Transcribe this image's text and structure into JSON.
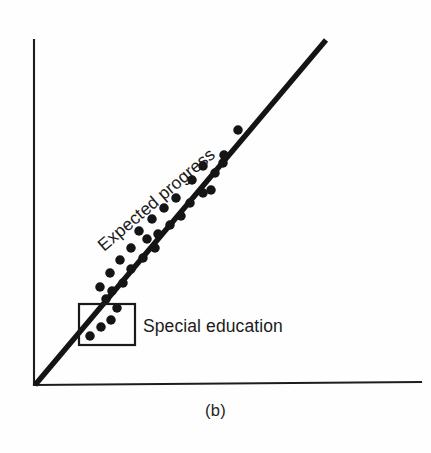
{
  "figure": {
    "caption": "(b)",
    "background_color": "#fefefe",
    "ink_color": "#151515",
    "labels": {
      "trend_line": "Expected progress",
      "callout": "Special education"
    }
  },
  "chart_data": {
    "type": "scatter",
    "title": "",
    "subtitle": "",
    "xlabel": "",
    "ylabel": "",
    "grid": false,
    "legend_position": "none",
    "axes": {
      "x_axis": {
        "x1": 34,
        "y1": 385,
        "x2": 421,
        "y2": 382,
        "ticks": [],
        "tick_labels": []
      },
      "y_axis": {
        "x1": 34,
        "y1": 40,
        "x2": 34,
        "y2": 385,
        "ticks": [],
        "tick_labels": []
      },
      "xlim": [
        0,
        1
      ],
      "ylim": [
        0,
        1
      ]
    },
    "series": [
      {
        "name": "Expected progress",
        "type": "line",
        "label": "Expected progress",
        "label_rotation_deg": -40.5,
        "label_anchor": {
          "x": 104,
          "y": 252
        },
        "points": [
          {
            "x": 35,
            "y": 385
          },
          {
            "x": 326,
            "y": 40
          }
        ]
      },
      {
        "name": "Observed pupil scores",
        "type": "scatter",
        "marker": "filled-circle",
        "marker_size_px": 9.5,
        "points": [
          {
            "x": 90,
            "y": 336
          },
          {
            "x": 101,
            "y": 327
          },
          {
            "x": 111,
            "y": 320
          },
          {
            "x": 117,
            "y": 308
          },
          {
            "x": 106,
            "y": 299
          },
          {
            "x": 112,
            "y": 291
          },
          {
            "x": 100,
            "y": 287
          },
          {
            "x": 123,
            "y": 283
          },
          {
            "x": 110,
            "y": 273
          },
          {
            "x": 131,
            "y": 269
          },
          {
            "x": 120,
            "y": 260
          },
          {
            "x": 143,
            "y": 258
          },
          {
            "x": 131,
            "y": 248
          },
          {
            "x": 155,
            "y": 248
          },
          {
            "x": 147,
            "y": 239
          },
          {
            "x": 158,
            "y": 234
          },
          {
            "x": 139,
            "y": 231
          },
          {
            "x": 170,
            "y": 225
          },
          {
            "x": 152,
            "y": 219
          },
          {
            "x": 181,
            "y": 216
          },
          {
            "x": 164,
            "y": 208
          },
          {
            "x": 190,
            "y": 203
          },
          {
            "x": 176,
            "y": 198
          },
          {
            "x": 203,
            "y": 193
          },
          {
            "x": 211,
            "y": 190
          },
          {
            "x": 192,
            "y": 180
          },
          {
            "x": 215,
            "y": 173
          },
          {
            "x": 203,
            "y": 166
          },
          {
            "x": 223,
            "y": 163
          },
          {
            "x": 224,
            "y": 155
          },
          {
            "x": 238,
            "y": 130
          }
        ]
      }
    ],
    "annotations": [
      {
        "kind": "rect-callout",
        "text": "Special education",
        "rect": {
          "x": 79,
          "y": 304,
          "width": 56,
          "height": 41
        },
        "text_anchor": {
          "x": 143,
          "y": 332
        }
      },
      {
        "kind": "figure-caption",
        "text": "(b)",
        "anchor": {
          "x": 215,
          "y": 418
        }
      }
    ]
  }
}
